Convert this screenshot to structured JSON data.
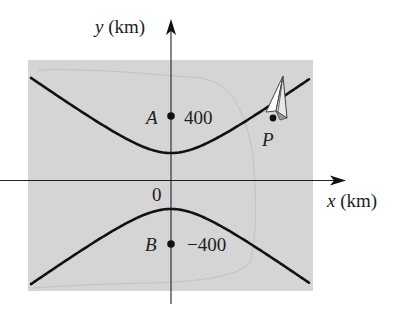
{
  "figure": {
    "background": "#ffffff",
    "map_region_color": "#d5d5d5",
    "landmass_outline_color": "#c2c2c2",
    "curve_color": "#111111",
    "axis_color": "#222222"
  },
  "axes": {
    "x_label": "x (km)",
    "x_label_var": "x",
    "x_label_unit": " (km)",
    "y_label": "y (km)",
    "y_label_var": "y",
    "y_label_unit": " (km)",
    "origin_label": "0"
  },
  "points": {
    "A": {
      "name": "A",
      "value_label": "400",
      "y": 400
    },
    "B": {
      "name": "B",
      "value_label": "−400",
      "y": -400
    },
    "P": {
      "name": "P"
    }
  },
  "hyperbola": {
    "description": "Hyperbola with foci A and B on the y-axis; aircraft at point P on the upper branch",
    "center_px": [
      171,
      181
    ],
    "a_px": 28,
    "b_px": 39.5,
    "x_range_px": [
      31,
      310
    ]
  },
  "icons": {
    "aircraft": "paper-plane-icon"
  }
}
